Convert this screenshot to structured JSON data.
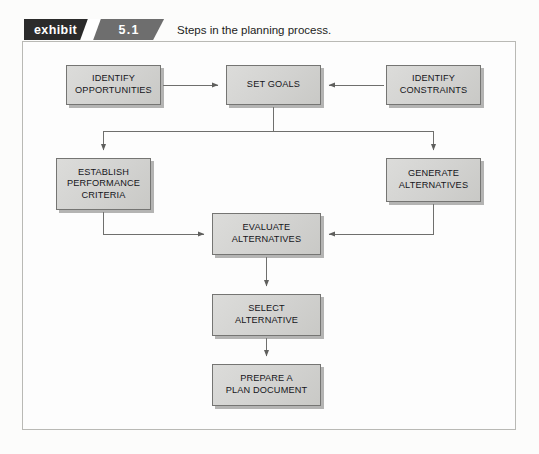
{
  "exhibit": {
    "tag_label": "exhibit",
    "number": "5.1",
    "caption": "Steps in the planning process."
  },
  "diagram": {
    "type": "flowchart",
    "nodes": [
      {
        "id": "identify-opportunities",
        "label": "IDENTIFY\nOPPORTUNITIES"
      },
      {
        "id": "set-goals",
        "label": "SET GOALS"
      },
      {
        "id": "identify-constraints",
        "label": "IDENTIFY\nCONSTRAINTS"
      },
      {
        "id": "establish-criteria",
        "label": "ESTABLISH\nPERFORMANCE\nCRITERIA"
      },
      {
        "id": "generate-alternatives",
        "label": "GENERATE\nALTERNATIVES"
      },
      {
        "id": "evaluate-alternatives",
        "label": "EVALUATE\nALTERNATIVES"
      },
      {
        "id": "select-alternative",
        "label": "SELECT\nALTERNATIVE"
      },
      {
        "id": "prepare-plan",
        "label": "PREPARE A\nPLAN DOCUMENT"
      }
    ],
    "edges": [
      {
        "from": "identify-opportunities",
        "to": "set-goals",
        "direction": "right"
      },
      {
        "from": "identify-constraints",
        "to": "set-goals",
        "direction": "left"
      },
      {
        "from": "set-goals",
        "to": "establish-criteria",
        "direction": "down"
      },
      {
        "from": "set-goals",
        "to": "generate-alternatives",
        "direction": "down"
      },
      {
        "from": "establish-criteria",
        "to": "evaluate-alternatives",
        "direction": "right"
      },
      {
        "from": "generate-alternatives",
        "to": "evaluate-alternatives",
        "direction": "left"
      },
      {
        "from": "evaluate-alternatives",
        "to": "select-alternative",
        "direction": "down"
      },
      {
        "from": "select-alternative",
        "to": "prepare-plan",
        "direction": "down"
      }
    ]
  },
  "colors": {
    "tag_background": "#2b2b2b",
    "number_background": "#6e6e6e",
    "node_fill": "#d4d4d2",
    "node_border": "#757573",
    "frame_border": "#b9b9b5",
    "connector": "#6f6f6d",
    "page_background": "#fcfcfb"
  }
}
